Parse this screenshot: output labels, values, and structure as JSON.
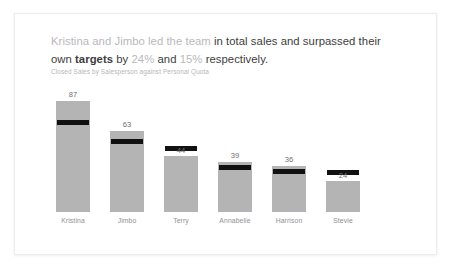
{
  "card": {
    "headline": {
      "segments": [
        {
          "text": "Kristina and Jimbo led the team ",
          "style": "muted"
        },
        {
          "text": "in total sales and surpassed their own ",
          "style": "normal"
        },
        {
          "text": "targets",
          "style": "strong"
        },
        {
          "text": " by ",
          "style": "normal"
        },
        {
          "text": "24%",
          "style": "num"
        },
        {
          "text": " and ",
          "style": "normal"
        },
        {
          "text": "15%",
          "style": "num"
        },
        {
          "text": " respectively.",
          "style": "normal"
        }
      ]
    },
    "subtitle": "Closed Sales by Salesperson against Personal Quota"
  },
  "chart_data": {
    "type": "bar",
    "title": "Kristina and Jimbo led the team in total sales and surpassed their own targets by 24% and 15% respectively.",
    "subtitle": "Closed Sales by Salesperson against Personal Quota",
    "xlabel": "",
    "ylabel": "",
    "ylim": [
      0,
      100
    ],
    "grid": false,
    "legend": false,
    "categories": [
      "Kristina",
      "Jimbo",
      "Terry",
      "Annabelle",
      "Harrison",
      "Stevie"
    ],
    "series": [
      {
        "name": "Closed Sales",
        "values": [
          87,
          63,
          44,
          39,
          36,
          24
        ]
      },
      {
        "name": "Personal Quota",
        "values": [
          70,
          55,
          50,
          35,
          32,
          31
        ]
      }
    ],
    "colors": {
      "bar": "#b4b4b4",
      "marker": "#111111",
      "value_label": "#6f6f71",
      "category_label": "#909092"
    },
    "bars": [
      {
        "category": "Kristina",
        "value": 87,
        "target": 70,
        "target_above_bar": false
      },
      {
        "category": "Jimbo",
        "value": 63,
        "target": 55,
        "target_above_bar": false
      },
      {
        "category": "Terry",
        "value": 44,
        "target": 50,
        "target_above_bar": true
      },
      {
        "category": "Annabelle",
        "value": 39,
        "target": 35,
        "target_above_bar": false
      },
      {
        "category": "Harrison",
        "value": 36,
        "target": 32,
        "target_above_bar": false
      },
      {
        "category": "Stevie",
        "value": 24,
        "target": 31,
        "target_above_bar": true
      }
    ]
  }
}
